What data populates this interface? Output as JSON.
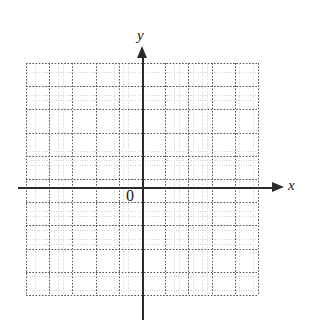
{
  "figure": {
    "background_color": "#ffffff"
  },
  "axes": {
    "x": {
      "label": "x",
      "color": "#2b2b2b",
      "arrow_icon": "arrow-right-icon",
      "pixel_y": 188,
      "pixel_start_x": 18,
      "pixel_end_x": 284
    },
    "y": {
      "label": "y",
      "color": "#2b2b2b",
      "arrow_icon": "arrow-up-icon",
      "pixel_x": 143,
      "pixel_start_y": 46,
      "pixel_end_y": 320
    },
    "origin_label": "0"
  },
  "grid": {
    "left": 26,
    "top": 63,
    "width": 232,
    "height": 232,
    "major_spacing_px": 23.2,
    "major_columns": 11,
    "major_rows": 11,
    "minor_per_major": 5,
    "major_color": "#555555",
    "minor_color": "#b9b9b9",
    "style": "dotted"
  },
  "chart_data": {
    "type": "scatter",
    "title": "",
    "subtitle": "",
    "xlabel": "x",
    "ylabel": "y",
    "series": [
      {
        "name": "",
        "x": [],
        "y": []
      }
    ],
    "x": [],
    "values": [],
    "categories": [],
    "xlim": [
      -5,
      5
    ],
    "ylim": [
      -4.4,
      5.4
    ],
    "xticks": [
      -5,
      -4,
      -3,
      -2,
      -1,
      0,
      1,
      2,
      3,
      4,
      5
    ],
    "yticks": [
      -4,
      -3,
      -2,
      -1,
      0,
      1,
      2,
      3,
      4,
      5
    ],
    "xticklabels": [
      "",
      "",
      "",
      "",
      "",
      "0",
      "",
      "",
      "",
      "",
      ""
    ],
    "yticklabels": [
      "",
      "",
      "",
      "",
      "",
      "",
      "",
      "",
      "",
      ""
    ],
    "grid": true,
    "grid_style": "dotted",
    "legend": false,
    "legend_position": "none",
    "annotations": [
      {
        "text": "0",
        "x": 0,
        "y": 0,
        "placement": "below-left-of-origin"
      },
      {
        "text": "y",
        "x": 0,
        "y": 5.4,
        "placement": "above-y-axis-arrow"
      },
      {
        "text": "x",
        "x": 5.6,
        "y": 0,
        "placement": "right-of-x-axis-arrow"
      }
    ]
  }
}
